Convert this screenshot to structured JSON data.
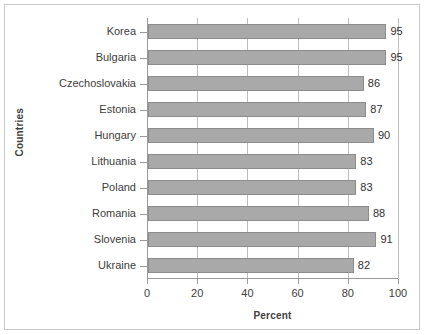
{
  "chart_data": {
    "type": "bar",
    "orientation": "horizontal",
    "title": "",
    "xlabel": "Percent",
    "ylabel": "Countries",
    "categories": [
      "Korea",
      "Bulgaria",
      "Czechoslovakia",
      "Estonia",
      "Hungary",
      "Lithuania",
      "Poland",
      "Romania",
      "Slovenia",
      "Ukraine"
    ],
    "values": [
      95,
      95,
      86,
      87,
      90,
      83,
      83,
      88,
      91,
      82
    ],
    "value_labels": [
      "95",
      "95",
      "86",
      "87",
      "90",
      "83",
      "83",
      "88",
      "91",
      "82"
    ],
    "xlim": [
      0,
      100
    ],
    "xticks": [
      0,
      20,
      40,
      60,
      80,
      100
    ],
    "xtick_labels": [
      "0",
      "20",
      "40",
      "60",
      "80",
      "100"
    ],
    "grid": true,
    "grid_axis": "x",
    "legend": null,
    "bar_color": "#a9a9a9",
    "bar_edge_color": "#8c8c8c",
    "axis_color": "#9a9a9a",
    "text_color": "#3d3d3d",
    "background": "#ffffff"
  }
}
